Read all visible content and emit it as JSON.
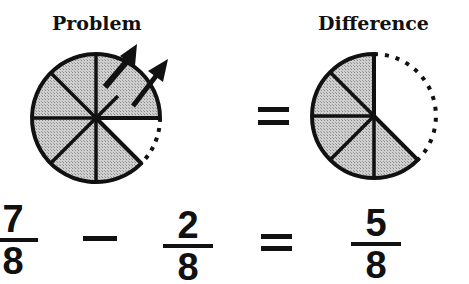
{
  "labels": {
    "problem": "Problem",
    "difference": "Difference"
  },
  "equation": {
    "minuend": {
      "numerator": "7",
      "denominator": "8"
    },
    "operator": "−",
    "subtrahend": {
      "numerator": "2",
      "denominator": "8"
    },
    "equals": "=",
    "result": {
      "numerator": "5",
      "denominator": "8"
    }
  },
  "pies": {
    "problem": {
      "total_slices": 8,
      "shaded_slices": 7,
      "removed_slices": 2,
      "missing_slice": "lower-right"
    },
    "difference": {
      "total_slices": 8,
      "shaded_slices": 5
    }
  },
  "colors": {
    "ink": "#111111",
    "shade": "#bdbdbd",
    "background": "#ffffff"
  }
}
